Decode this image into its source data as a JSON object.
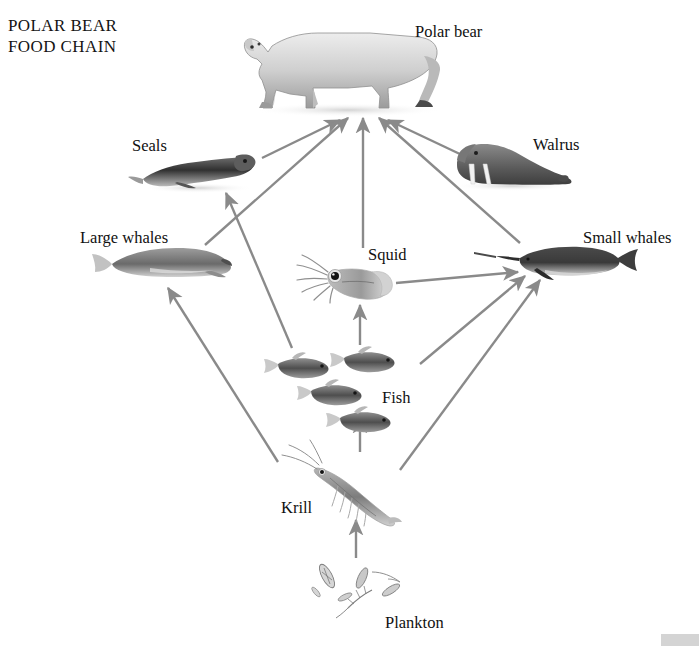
{
  "title": {
    "line1": "POLAR BEAR",
    "line2": "FOOD CHAIN",
    "full": "POLAR BEAR\nFOOD CHAIN"
  },
  "colors": {
    "background": "#ffffff",
    "arrow": "#8a8a8a",
    "text": "#111111",
    "animal_dark": "#3a3a3a",
    "animal_mid": "#8d8d8d",
    "animal_light": "#d8d8d8",
    "corner_artifact": "#d4d4d4"
  },
  "nodes": [
    {
      "id": "polar-bear",
      "label": "Polar bear",
      "label_x": 415,
      "label_y": 22,
      "art_x": 250,
      "art_y": 18,
      "art_w": 200,
      "art_h": 95,
      "trophic": "apex predator"
    },
    {
      "id": "seals",
      "label": "Seals",
      "label_x": 132,
      "label_y": 136,
      "art_x": 140,
      "art_y": 152,
      "art_w": 118,
      "art_h": 40,
      "trophic": "predator"
    },
    {
      "id": "walrus",
      "label": "Walrus",
      "label_x": 533,
      "label_y": 135,
      "art_x": 450,
      "art_y": 140,
      "art_w": 120,
      "art_h": 50,
      "trophic": "predator"
    },
    {
      "id": "large-whales",
      "label": "Large whales",
      "label_x": 80,
      "label_y": 228,
      "art_x": 88,
      "art_y": 246,
      "art_w": 140,
      "art_h": 40,
      "trophic": "filter feeder"
    },
    {
      "id": "small-whales",
      "label": "Small whales",
      "label_x": 583,
      "label_y": 228,
      "art_x": 505,
      "art_y": 244,
      "art_w": 130,
      "art_h": 38,
      "trophic": "predator"
    },
    {
      "id": "squid",
      "label": "Squid",
      "label_x": 368,
      "label_y": 245,
      "art_x": 292,
      "art_y": 252,
      "art_w": 98,
      "art_h": 48,
      "trophic": "predator"
    },
    {
      "id": "fish",
      "label": "Fish",
      "label_x": 382,
      "label_y": 388,
      "art_x": 268,
      "art_y": 350,
      "art_w": 150,
      "art_h": 82,
      "trophic": "consumer"
    },
    {
      "id": "krill",
      "label": "Krill",
      "label_x": 281,
      "label_y": 498,
      "art_x": 278,
      "art_y": 455,
      "art_w": 120,
      "art_h": 65,
      "trophic": "primary consumer"
    },
    {
      "id": "plankton",
      "label": "Plankton",
      "label_x": 385,
      "label_y": 613,
      "art_x": 312,
      "art_y": 556,
      "art_w": 110,
      "art_h": 62,
      "trophic": "producer"
    }
  ],
  "arrows": [
    {
      "id": "seals-to-polar-bear",
      "from": "seals",
      "to": "polar-bear",
      "x1": 262,
      "y1": 158,
      "x2": 340,
      "y2": 120
    },
    {
      "id": "large-whales-to-polar-bear",
      "from": "large-whales",
      "to": "polar-bear",
      "x1": 205,
      "y1": 245,
      "x2": 348,
      "y2": 118
    },
    {
      "id": "squid-to-polar-bear",
      "from": "squid",
      "to": "polar-bear",
      "x1": 363,
      "y1": 248,
      "x2": 363,
      "y2": 118
    },
    {
      "id": "small-whales-to-polar-bear",
      "from": "small-whales",
      "to": "polar-bear",
      "x1": 520,
      "y1": 243,
      "x2": 379,
      "y2": 118
    },
    {
      "id": "walrus-to-polar-bear",
      "from": "walrus",
      "to": "polar-bear",
      "x1": 462,
      "y1": 155,
      "x2": 388,
      "y2": 120
    },
    {
      "id": "fish-to-seals",
      "from": "fish",
      "to": "seals",
      "x1": 292,
      "y1": 348,
      "x2": 226,
      "y2": 193
    },
    {
      "id": "krill-to-large-whales",
      "from": "krill",
      "to": "large-whales",
      "x1": 278,
      "y1": 462,
      "x2": 168,
      "y2": 288
    },
    {
      "id": "krill-to-fish",
      "from": "krill",
      "to": "fish",
      "x1": 360,
      "y1": 452,
      "x2": 360,
      "y2": 418
    },
    {
      "id": "fish-to-squid",
      "from": "fish",
      "to": "squid",
      "x1": 360,
      "y1": 345,
      "x2": 360,
      "y2": 305
    },
    {
      "id": "squid-to-small-whales",
      "from": "squid",
      "to": "small-whales",
      "x1": 396,
      "y1": 283,
      "x2": 518,
      "y2": 272
    },
    {
      "id": "fish-to-small-whales",
      "from": "fish",
      "to": "small-whales",
      "x1": 420,
      "y1": 364,
      "x2": 525,
      "y2": 276
    },
    {
      "id": "krill-to-small-whales",
      "from": "krill",
      "to": "small-whales",
      "x1": 400,
      "y1": 470,
      "x2": 540,
      "y2": 280
    },
    {
      "id": "plankton-to-krill",
      "from": "plankton",
      "to": "krill",
      "x1": 356,
      "y1": 558,
      "x2": 356,
      "y2": 520
    }
  ]
}
